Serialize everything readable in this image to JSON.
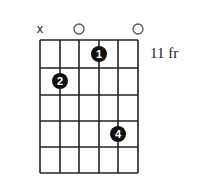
{
  "diagram": {
    "type": "guitar-chord",
    "fret_position_label": "11 fr",
    "strings": 6,
    "frets_shown": 5,
    "string_markers": [
      "x",
      "",
      "o",
      "",
      "",
      "o"
    ],
    "fingers": [
      {
        "finger": "1",
        "string": 4,
        "fret": 1
      },
      {
        "finger": "2",
        "string": 2,
        "fret": 2
      },
      {
        "finger": "4",
        "string": 5,
        "fret": 4
      }
    ]
  }
}
